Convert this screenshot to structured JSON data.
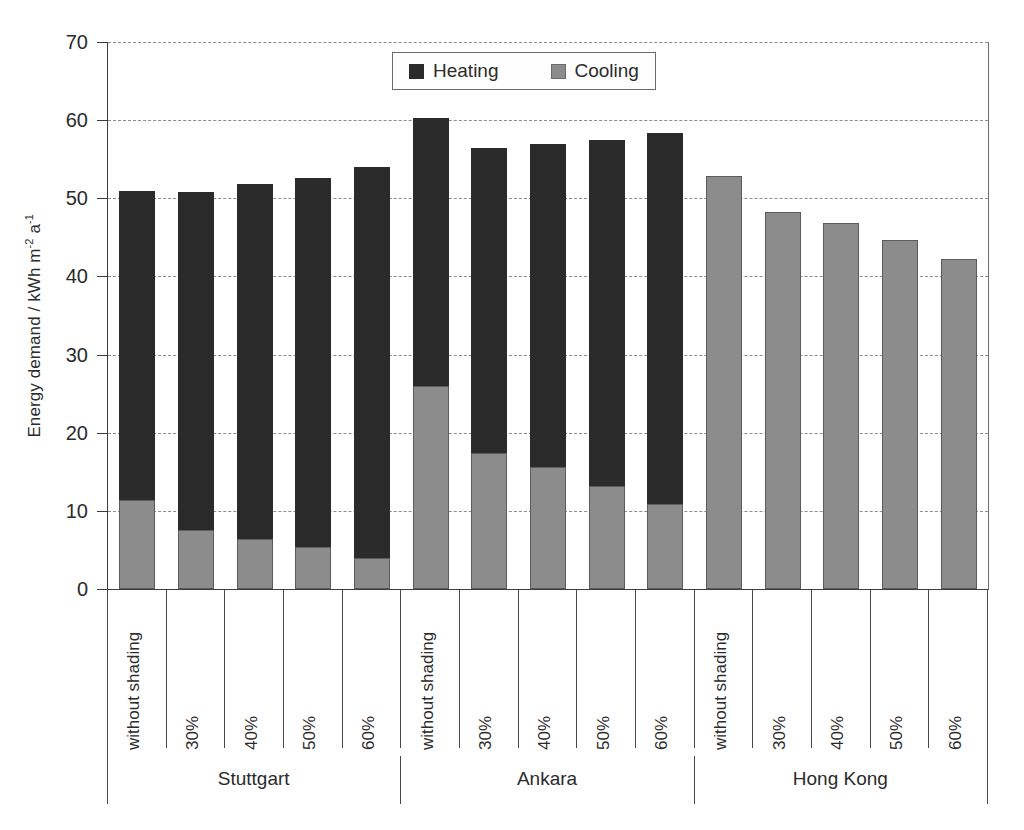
{
  "chart_data": {
    "type": "bar",
    "stacked": true,
    "title": "",
    "xlabel": "",
    "ylabel": "Energy demand / kWh m-2 a-1",
    "ylabel_parts": {
      "main": "Energy demand / kWh m",
      "sup1": "-2",
      "mid": " a",
      "sup2": "-1"
    },
    "ylim": [
      0,
      70
    ],
    "ytick_values": [
      0,
      10,
      20,
      30,
      40,
      50,
      60,
      70
    ],
    "ytick_labels": [
      "0",
      "10",
      "20",
      "30",
      "40",
      "50",
      "60",
      "70"
    ],
    "grid": true,
    "grid_style": "dashed-horizontal",
    "legend": {
      "position": "top-center-inside",
      "entries": [
        {
          "name": "Heating",
          "color": "#2b2b2b"
        },
        {
          "name": "Cooling",
          "color": "#8c8c8c"
        }
      ]
    },
    "groups": [
      "Stuttgart",
      "Ankara",
      "Hong Kong"
    ],
    "categories": [
      "without shading",
      "30%",
      "40%",
      "50%",
      "60%"
    ],
    "series": [
      {
        "name": "Cooling",
        "color": "#8c8c8c"
      },
      {
        "name": "Heating",
        "color": "#2b2b2b"
      }
    ],
    "bars": [
      {
        "group": "Stuttgart",
        "category": "without shading",
        "cooling": 11.4,
        "heating": 39.5,
        "total": 50.9
      },
      {
        "group": "Stuttgart",
        "category": "30%",
        "cooling": 7.5,
        "heating": 43.3,
        "total": 50.8
      },
      {
        "group": "Stuttgart",
        "category": "40%",
        "cooling": 6.4,
        "heating": 45.4,
        "total": 51.8
      },
      {
        "group": "Stuttgart",
        "category": "50%",
        "cooling": 5.4,
        "heating": 47.2,
        "total": 52.6
      },
      {
        "group": "Stuttgart",
        "category": "60%",
        "cooling": 4.0,
        "heating": 50.0,
        "total": 54.0
      },
      {
        "group": "Ankara",
        "category": "without shading",
        "cooling": 26.0,
        "heating": 34.3,
        "total": 60.3
      },
      {
        "group": "Ankara",
        "category": "30%",
        "cooling": 17.4,
        "heating": 39.1,
        "total": 56.5
      },
      {
        "group": "Ankara",
        "category": "40%",
        "cooling": 15.6,
        "heating": 41.4,
        "total": 57.0
      },
      {
        "group": "Ankara",
        "category": "50%",
        "cooling": 13.2,
        "heating": 44.3,
        "total": 57.5
      },
      {
        "group": "Ankara",
        "category": "60%",
        "cooling": 10.9,
        "heating": 47.4,
        "total": 58.3
      },
      {
        "group": "Hong Kong",
        "category": "without shading",
        "cooling": 52.9,
        "heating": 0,
        "total": 52.9
      },
      {
        "group": "Hong Kong",
        "category": "30%",
        "cooling": 48.3,
        "heating": 0,
        "total": 48.3
      },
      {
        "group": "Hong Kong",
        "category": "40%",
        "cooling": 46.9,
        "heating": 0,
        "total": 46.9
      },
      {
        "group": "Hong Kong",
        "category": "50%",
        "cooling": 44.6,
        "heating": 0,
        "total": 44.6
      },
      {
        "group": "Hong Kong",
        "category": "60%",
        "cooling": 42.2,
        "heating": 0,
        "total": 42.2
      }
    ]
  },
  "colors": {
    "heating": "#2b2b2b",
    "cooling": "#8c8c8c",
    "axis": "#3c3c3c",
    "grid": "#8b8b93",
    "background": "#ffffff"
  }
}
